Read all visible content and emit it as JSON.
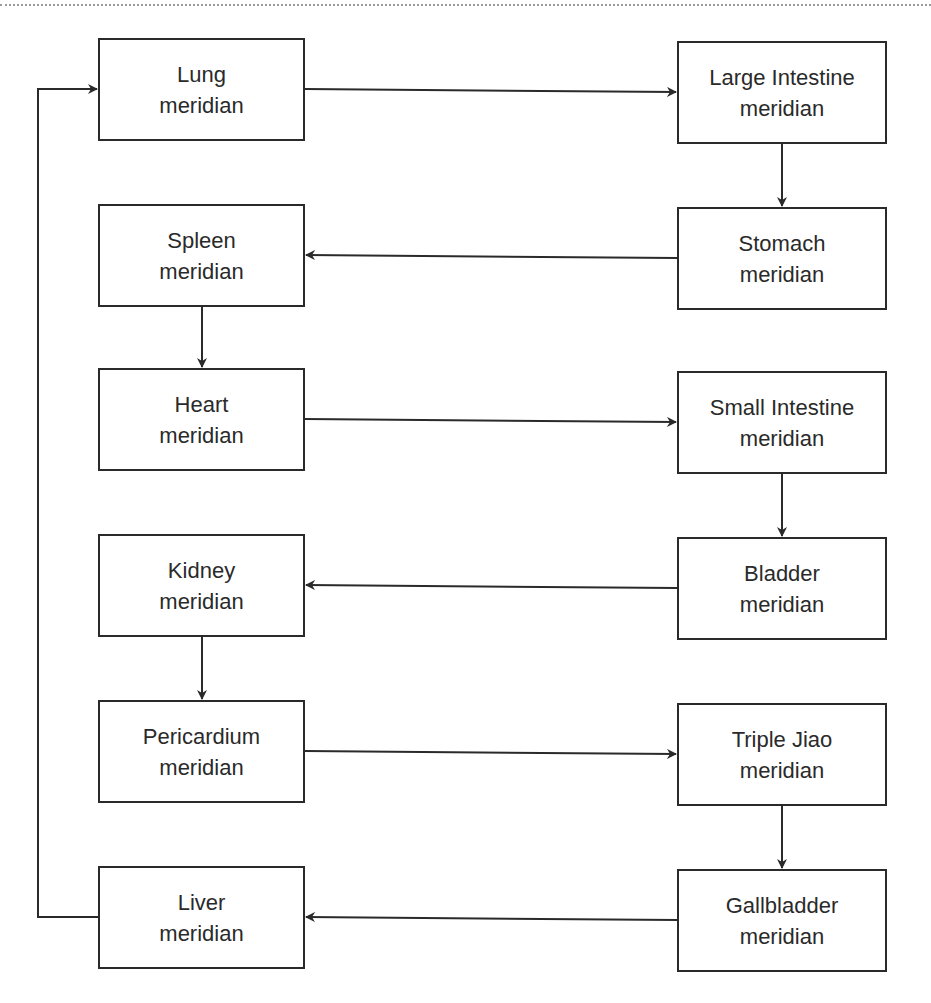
{
  "diagram": {
    "type": "flowchart",
    "nodes": [
      {
        "id": "lung",
        "line1": "Lung",
        "line2": "meridian",
        "x": 98,
        "y": 38,
        "w": 207,
        "h": 103
      },
      {
        "id": "large-intestine",
        "line1": "Large Intestine",
        "line2": "meridian",
        "x": 677,
        "y": 41,
        "w": 210,
        "h": 103
      },
      {
        "id": "stomach",
        "line1": "Stomach",
        "line2": "meridian",
        "x": 677,
        "y": 207,
        "w": 210,
        "h": 103
      },
      {
        "id": "spleen",
        "line1": "Spleen",
        "line2": "meridian",
        "x": 98,
        "y": 204,
        "w": 207,
        "h": 103
      },
      {
        "id": "heart",
        "line1": "Heart",
        "line2": "meridian",
        "x": 98,
        "y": 368,
        "w": 207,
        "h": 103
      },
      {
        "id": "small-intestine",
        "line1": "Small Intestine",
        "line2": "meridian",
        "x": 677,
        "y": 371,
        "w": 210,
        "h": 103
      },
      {
        "id": "bladder",
        "line1": "Bladder",
        "line2": "meridian",
        "x": 677,
        "y": 537,
        "w": 210,
        "h": 103
      },
      {
        "id": "kidney",
        "line1": "Kidney",
        "line2": "meridian",
        "x": 98,
        "y": 534,
        "w": 207,
        "h": 103
      },
      {
        "id": "pericardium",
        "line1": "Pericardium",
        "line2": "meridian",
        "x": 98,
        "y": 700,
        "w": 207,
        "h": 103
      },
      {
        "id": "triple-jiao",
        "line1": "Triple Jiao",
        "line2": "meridian",
        "x": 677,
        "y": 703,
        "w": 210,
        "h": 103
      },
      {
        "id": "gallbladder",
        "line1": "Gallbladder",
        "line2": "meridian",
        "x": 677,
        "y": 869,
        "w": 210,
        "h": 103
      },
      {
        "id": "liver",
        "line1": "Liver",
        "line2": "meridian",
        "x": 98,
        "y": 866,
        "w": 207,
        "h": 103
      }
    ],
    "edges": [
      {
        "from": "Lung meridian",
        "to": "Large Intestine meridian"
      },
      {
        "from": "Large Intestine meridian",
        "to": "Stomach meridian"
      },
      {
        "from": "Stomach meridian",
        "to": "Spleen meridian"
      },
      {
        "from": "Spleen meridian",
        "to": "Heart meridian"
      },
      {
        "from": "Heart meridian",
        "to": "Small Intestine meridian"
      },
      {
        "from": "Small Intestine meridian",
        "to": "Bladder meridian"
      },
      {
        "from": "Bladder meridian",
        "to": "Kidney meridian"
      },
      {
        "from": "Kidney meridian",
        "to": "Pericardium meridian"
      },
      {
        "from": "Pericardium meridian",
        "to": "Triple Jiao meridian"
      },
      {
        "from": "Triple Jiao meridian",
        "to": "Gallbladder meridian"
      },
      {
        "from": "Gallbladder meridian",
        "to": "Liver meridian"
      },
      {
        "from": "Liver meridian",
        "to": "Lung meridian"
      }
    ],
    "colors": {
      "stroke": "#2a2a2a",
      "background": "#ffffff"
    }
  }
}
